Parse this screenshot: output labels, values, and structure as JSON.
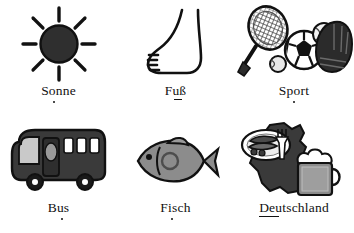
{
  "document": {
    "kind": "vocabulary-picture-sheet",
    "language": "German",
    "columns": 3,
    "rows": 2,
    "background_color": "#ffffff",
    "ink_color": "#111111"
  },
  "palette": {
    "ink": "#1a1a1a",
    "dark_fill": "#3a3a3a",
    "mid_gray": "#8c8c8c",
    "light_gray": "#c9c9c9",
    "white": "#ffffff"
  },
  "cells": [
    {
      "id": "sonne",
      "label": "Sonne",
      "icon": "sun-icon",
      "stress_mark": "dot-under-o",
      "icon_parts": [
        "sun-disc",
        "sun-rays"
      ]
    },
    {
      "id": "fuss",
      "label": "Fuß",
      "icon": "foot-icon",
      "stress_mark": "underline-under-u",
      "icon_parts": [
        "foot-outline",
        "toe-lines"
      ]
    },
    {
      "id": "sport",
      "label": "Sport",
      "icon": "sport-icon",
      "stress_mark": "dot-under-p",
      "icon_parts": [
        "tennis-racket",
        "tennis-ball",
        "soccer-ball",
        "baseball-glove",
        "baseball"
      ]
    },
    {
      "id": "bus",
      "label": "Bus",
      "icon": "bus-icon",
      "stress_mark": "dot-under-u",
      "icon_parts": [
        "bus-body",
        "windshield",
        "door",
        "side-windows",
        "wheels"
      ]
    },
    {
      "id": "fisch",
      "label": "Fisch",
      "icon": "fish-icon",
      "stress_mark": "dot-under-i",
      "icon_parts": [
        "fish-body",
        "fish-eye",
        "fish-fin",
        "fish-tail",
        "fish-gill"
      ]
    },
    {
      "id": "deutschland",
      "label": "Deutschland",
      "icon": "germany-icon",
      "stress_mark": "underline-under-deu",
      "icon_parts": [
        "germany-map",
        "sausage-plate",
        "fork",
        "beer-mug",
        "beer-foam"
      ]
    }
  ]
}
